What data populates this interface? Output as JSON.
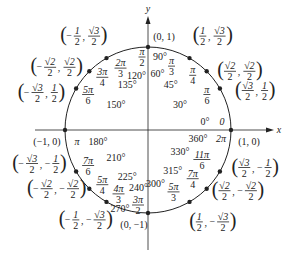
{
  "diagram": {
    "axes": {
      "x_label": "x",
      "y_label": "y"
    },
    "center": {
      "x": 148,
      "y": 130
    },
    "radius": 83,
    "colors": {
      "ink": "#222222",
      "background": "#ffffff"
    },
    "points": [
      {
        "deg": 0,
        "deg_label": "0°",
        "rad_label": "0",
        "alt_deg_label": "360°",
        "alt_rad_label": "2π",
        "coord": "(1, 0)"
      },
      {
        "deg": 30,
        "deg_label": "30°",
        "rad_label": "π/6",
        "coord": "(√3/2, 1/2)"
      },
      {
        "deg": 45,
        "deg_label": "45°",
        "rad_label": "π/4",
        "coord": "(√2/2, √2/2)"
      },
      {
        "deg": 60,
        "deg_label": "60°",
        "rad_label": "π/3",
        "coord": "(1/2, √3/2)"
      },
      {
        "deg": 90,
        "deg_label": "90°",
        "rad_label": "π/2",
        "coord": "(0, 1)"
      },
      {
        "deg": 120,
        "deg_label": "120°",
        "rad_label": "2π/3",
        "coord": "(−1/2, √3/2)"
      },
      {
        "deg": 135,
        "deg_label": "135°",
        "rad_label": "3π/4",
        "coord": "(−√2/2, √2/2)"
      },
      {
        "deg": 150,
        "deg_label": "150°",
        "rad_label": "5π/6",
        "coord": "(−√3/2, 1/2)"
      },
      {
        "deg": 180,
        "deg_label": "180°",
        "rad_label": "π",
        "coord": "(−1, 0)"
      },
      {
        "deg": 210,
        "deg_label": "210°",
        "rad_label": "7π/6",
        "coord": "(−√3/2, −1/2)"
      },
      {
        "deg": 225,
        "deg_label": "225°",
        "rad_label": "5π/4",
        "coord": "(−√2/2, −√2/2)"
      },
      {
        "deg": 240,
        "deg_label": "240°",
        "rad_label": "4π/3",
        "coord": "(−1/2, −√3/2)"
      },
      {
        "deg": 270,
        "deg_label": "270°",
        "rad_label": "3π/2",
        "coord": "(0, −1)"
      },
      {
        "deg": 300,
        "deg_label": "300°",
        "rad_label": "5π/3",
        "coord": "(1/2, −√3/2)"
      },
      {
        "deg": 315,
        "deg_label": "315°",
        "rad_label": "7π/4",
        "coord": "(√2/2, −√2/2)"
      },
      {
        "deg": 330,
        "deg_label": "330°",
        "rad_label": "11π/6",
        "coord": "(√3/2, −1/2)"
      }
    ]
  }
}
